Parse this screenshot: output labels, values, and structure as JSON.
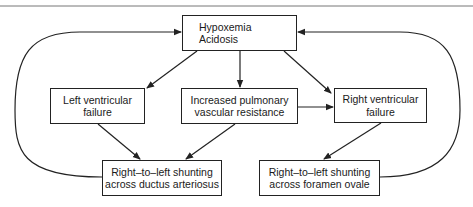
{
  "diagram": {
    "nodes": {
      "hypoxemia": {
        "line1": "Hypoxemia",
        "line2": "Acidosis"
      },
      "lv_failure": {
        "line1": "Left ventricular",
        "line2": "failure"
      },
      "pvr": {
        "line1": "Increased pulmonary",
        "line2": "vascular resistance"
      },
      "rv_failure": {
        "line1": "Right ventricular",
        "line2": "failure"
      },
      "ductus": {
        "line1": "Right–to–left shunting",
        "line2": "across ductus arteriosus"
      },
      "foramen": {
        "line1": "Right–to–left shunting",
        "line2": "across foramen ovale"
      }
    },
    "edges": [
      {
        "from": "Hypoxemia Acidosis",
        "to": "Left ventricular failure"
      },
      {
        "from": "Hypoxemia Acidosis",
        "to": "Increased pulmonary vascular resistance"
      },
      {
        "from": "Hypoxemia Acidosis",
        "to": "Right ventricular failure"
      },
      {
        "from": "Increased pulmonary vascular resistance",
        "to": "Right ventricular failure"
      },
      {
        "from": "Left ventricular failure",
        "to": "Right-to-left shunting across ductus arteriosus"
      },
      {
        "from": "Increased pulmonary vascular resistance",
        "to": "Right-to-left shunting across ductus arteriosus"
      },
      {
        "from": "Right ventricular failure",
        "to": "Right-to-left shunting across foramen ovale"
      },
      {
        "from": "Right-to-left shunting across ductus arteriosus",
        "to": "Hypoxemia Acidosis"
      },
      {
        "from": "Right-to-left shunting across foramen ovale",
        "to": "Hypoxemia Acidosis"
      }
    ],
    "colors": {
      "line": "#222222",
      "background": "#ffffff"
    }
  }
}
